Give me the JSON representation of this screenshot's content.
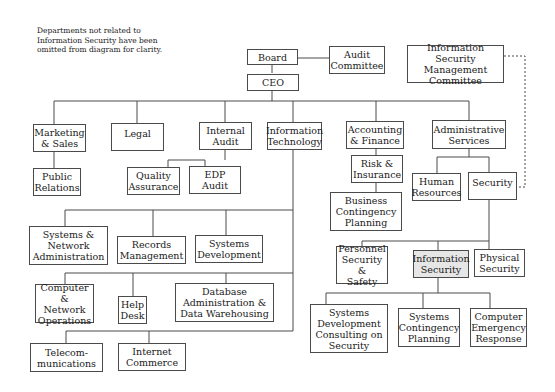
{
  "note": "Departments not related to\nInformation Security have been\nomitted from diagram for clarity.",
  "highlight_color": "#e6e6e6",
  "nodes": {
    "board": "Board",
    "audit_committee": "Audit\nCommittee",
    "ismc": "Information Security\nManagement\nCommittee",
    "ceo": "CEO",
    "marketing": "Marketing\n& Sales",
    "legal": "Legal",
    "internal_audit": "Internal\nAudit",
    "it": "Information\nTechnology",
    "accounting": "Accounting\n& Finance",
    "admin": "Administrative\nServices",
    "pr": "Public\nRelations",
    "qa": "Quality\nAssurance",
    "edp": "EDP\nAudit",
    "risk": "Risk &\nInsurance",
    "bcp": "Business\nContingency\nPlanning",
    "hr": "Human\nResources",
    "security": "Security",
    "sna": "Systems &\nNetwork\nAdministration",
    "records": "Records\nManagement",
    "sysdev": "Systems\nDevelopment",
    "cno": "Computer &\nNetwork\nOperations",
    "helpdesk": "Help\nDesk",
    "dba": "Database\nAdministration &\nData Warehousing",
    "telecom": "Telecom-\nmunications",
    "ecommerce": "Internet\nCommerce",
    "personnel": "Personnel\nSecurity &\nSafety",
    "infosec": "Information\nSecurity",
    "physical": "Physical\nSecurity",
    "sdcs": "Systems\nDevelopment\nConsulting on\nSecurity",
    "scp": "Systems\nContingency\nPlanning",
    "cer": "Computer\nEmergency\nResponse"
  }
}
